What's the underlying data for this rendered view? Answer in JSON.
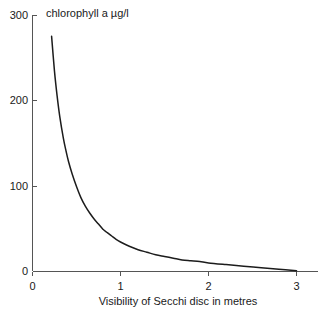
{
  "chart_data": {
    "type": "line",
    "title": "",
    "annotation": "chlorophyll a µg/l",
    "xlabel": "Visibility of Secchi disc in metres",
    "ylabel": "",
    "xlim": [
      0,
      3.3
    ],
    "ylim": [
      0,
      310
    ],
    "xticks": [
      0,
      1,
      2,
      3
    ],
    "xtick_labels": [
      "0",
      "1",
      "2",
      "3"
    ],
    "yticks": [
      0,
      100,
      200,
      300
    ],
    "ytick_labels": [
      "0",
      "100",
      "200",
      "300"
    ],
    "grid": false,
    "legend": false,
    "series": [
      {
        "name": "chlorophyll a",
        "color": "#1c1c1c",
        "x": [
          0.217,
          0.25,
          0.28,
          0.31,
          0.35,
          0.38,
          0.41,
          0.45,
          0.5,
          0.55,
          0.6,
          0.65,
          0.7,
          0.75,
          0.8,
          0.85,
          0.9,
          0.95,
          1.0,
          1.1,
          1.2,
          1.3,
          1.4,
          1.5,
          1.6,
          1.7,
          1.8,
          1.9,
          2.0,
          2.2,
          2.4,
          2.6,
          2.8,
          3.0
        ],
        "y": [
          275,
          234,
          205,
          181,
          156,
          141,
          128,
          114,
          99,
          86,
          76,
          68,
          61,
          55,
          49,
          45,
          41,
          37,
          34,
          29,
          25,
          22,
          19,
          17,
          15,
          13,
          12,
          11,
          9.5,
          7.5,
          5.6,
          3.8,
          2.0,
          0.2
        ]
      }
    ]
  },
  "axis_labels": {
    "x_title": "Visibility of Secchi disc in metres",
    "y_tick_0": "0",
    "y_tick_100": "100",
    "y_tick_200": "200",
    "y_tick_300": "300",
    "x_tick_0": "0",
    "x_tick_1": "1",
    "x_tick_2": "2",
    "x_tick_3": "3"
  },
  "plot_annotation": {
    "text": "chlorophyll a µg/l"
  },
  "colors": {
    "curve": "#1c1c1c",
    "axis": "#555555",
    "text": "#1a1a1a",
    "background": "#ffffff"
  }
}
